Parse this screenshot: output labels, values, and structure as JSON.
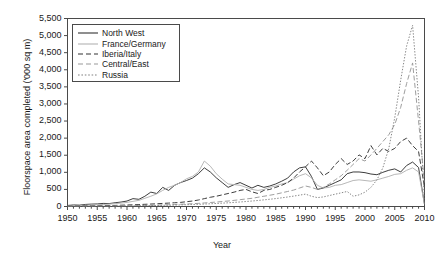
{
  "chart_data": {
    "type": "line",
    "title": "",
    "xlabel": "Year",
    "ylabel": "Floorspace area completed ('000 sq m)",
    "xlim": [
      1950,
      2010
    ],
    "ylim": [
      0,
      5500
    ],
    "ytick_step": 500,
    "xtick_step": 5,
    "minor_xticks": true,
    "grid": false,
    "legend_position": "top-left",
    "ytick_labels": [
      "0",
      "500",
      "1,000",
      "1,500",
      "2,000",
      "2,500",
      "3,000",
      "3,500",
      "4,000",
      "4,500",
      "5,000",
      "5,500"
    ],
    "ytick_values": [
      0,
      500,
      1000,
      1500,
      2000,
      2500,
      3000,
      3500,
      4000,
      4500,
      5000,
      5500
    ],
    "xtick_labels": [
      "1950",
      "1955",
      "1960",
      "1965",
      "1970",
      "1975",
      "1980",
      "1985",
      "1990",
      "1995",
      "2000",
      "2005",
      "2010"
    ],
    "xtick_values": [
      1950,
      1955,
      1960,
      1965,
      1970,
      1975,
      1980,
      1985,
      1990,
      1995,
      2000,
      2005,
      2010
    ],
    "x": [
      1950,
      1951,
      1952,
      1953,
      1954,
      1955,
      1956,
      1957,
      1958,
      1959,
      1960,
      1961,
      1962,
      1963,
      1964,
      1965,
      1966,
      1967,
      1968,
      1969,
      1970,
      1971,
      1972,
      1973,
      1974,
      1975,
      1976,
      1977,
      1978,
      1979,
      1980,
      1981,
      1982,
      1983,
      1984,
      1985,
      1986,
      1987,
      1988,
      1989,
      1990,
      1991,
      1992,
      1993,
      1994,
      1995,
      1996,
      1997,
      1998,
      1999,
      2000,
      2001,
      2002,
      2003,
      2004,
      2005,
      2006,
      2007,
      2008,
      2009,
      2010
    ],
    "series": [
      {
        "name": "North West",
        "color": "#333333",
        "dash": "solid",
        "values": [
          30,
          45,
          40,
          60,
          70,
          75,
          90,
          85,
          110,
          130,
          160,
          230,
          210,
          300,
          420,
          380,
          560,
          470,
          620,
          700,
          760,
          830,
          960,
          1130,
          1010,
          840,
          700,
          560,
          640,
          700,
          620,
          540,
          620,
          560,
          600,
          660,
          740,
          830,
          1010,
          1130,
          1160,
          880,
          500,
          540,
          620,
          700,
          780,
          960,
          1010,
          1010,
          990,
          950,
          930,
          1000,
          1060,
          1100,
          1010,
          1200,
          1300,
          1140,
          60
        ]
      },
      {
        "name": "France/Germany",
        "color": "#b3b3b3",
        "dash": "solid",
        "values": [
          20,
          25,
          30,
          35,
          45,
          50,
          60,
          70,
          85,
          100,
          120,
          150,
          180,
          240,
          300,
          370,
          470,
          560,
          620,
          700,
          810,
          880,
          1010,
          1330,
          1180,
          960,
          800,
          660,
          640,
          620,
          560,
          500,
          470,
          500,
          560,
          600,
          660,
          700,
          800,
          900,
          960,
          840,
          620,
          540,
          560,
          620,
          640,
          700,
          760,
          780,
          760,
          740,
          780,
          830,
          880,
          940,
          960,
          1060,
          1130,
          1010,
          60
        ]
      },
      {
        "name": "Iberia/Italy",
        "color": "#333333",
        "dash": "dashed",
        "values": [
          10,
          12,
          14,
          16,
          18,
          20,
          24,
          28,
          32,
          38,
          44,
          50,
          56,
          64,
          72,
          80,
          90,
          100,
          110,
          120,
          140,
          160,
          190,
          230,
          270,
          300,
          340,
          380,
          420,
          470,
          500,
          430,
          380,
          470,
          500,
          560,
          620,
          700,
          830,
          1010,
          1160,
          1330,
          1130,
          900,
          1010,
          1230,
          1400,
          1230,
          1330,
          1510,
          1400,
          1780,
          1510,
          1700,
          1610,
          1700,
          1900,
          2000,
          1780,
          1610,
          560
        ]
      },
      {
        "name": "Central/East",
        "color": "#999999",
        "dash": "dashed",
        "values": [
          5,
          6,
          7,
          8,
          9,
          10,
          12,
          14,
          16,
          18,
          20,
          24,
          28,
          32,
          36,
          40,
          46,
          52,
          58,
          66,
          74,
          82,
          92,
          104,
          116,
          130,
          146,
          160,
          180,
          200,
          220,
          240,
          270,
          300,
          330,
          360,
          400,
          440,
          480,
          540,
          600,
          560,
          500,
          560,
          660,
          780,
          900,
          1060,
          1230,
          1400,
          1330,
          1510,
          1700,
          1900,
          2100,
          2400,
          2900,
          3600,
          4200,
          2500,
          700
        ]
      },
      {
        "name": "Russia",
        "color": "#808080",
        "dash": "dotted",
        "values": [
          4,
          5,
          6,
          7,
          8,
          9,
          10,
          11,
          13,
          15,
          17,
          19,
          21,
          24,
          27,
          30,
          34,
          38,
          42,
          47,
          52,
          58,
          64,
          72,
          80,
          88,
          98,
          108,
          120,
          132,
          146,
          160,
          176,
          194,
          212,
          232,
          254,
          278,
          304,
          332,
          362,
          300,
          260,
          280,
          320,
          360,
          400,
          440,
          300,
          340,
          420,
          560,
          780,
          1130,
          1700,
          2600,
          3700,
          4700,
          5300,
          3200,
          180
        ]
      }
    ]
  },
  "legend": {
    "items": [
      {
        "label": "North West"
      },
      {
        "label": "France/Germany"
      },
      {
        "label": "Iberia/Italy"
      },
      {
        "label": "Central/East"
      },
      {
        "label": "Russia"
      }
    ]
  }
}
